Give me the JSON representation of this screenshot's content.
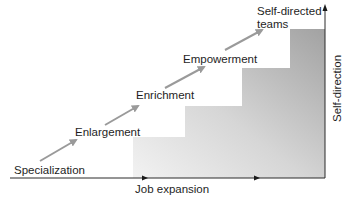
{
  "diagram": {
    "type": "staircase",
    "stages": [
      {
        "label": "Specialization"
      },
      {
        "label": "Enlargement"
      },
      {
        "label": "Enrichment"
      },
      {
        "label": "Empowerment"
      },
      {
        "label": "Self-directed",
        "label_line2": "teams"
      }
    ],
    "x_axis_label": "Job expansion",
    "y_axis_label": "Self-direction",
    "colors": {
      "arrow": "#9a9a9a",
      "axis": "#2a2a2a",
      "step_light": "#ececec",
      "step_dark": "#a8a8a8"
    }
  }
}
